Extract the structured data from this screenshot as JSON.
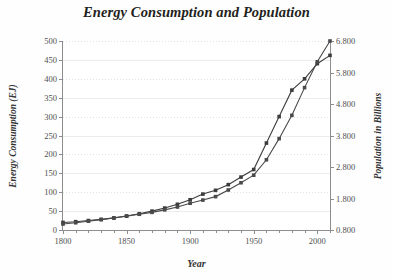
{
  "chart_data": {
    "type": "line",
    "title": "Energy Consumption and Population",
    "xlabel": "Year",
    "ylabel": "Energy Consumption (EJ)",
    "y2label": "Population in Billions",
    "grid": true,
    "legend": "none",
    "xlim": [
      1800,
      2010
    ],
    "ylim": [
      0,
      500
    ],
    "y2lim": [
      0.8,
      6.8
    ],
    "xticklabels": [
      "1800",
      "1850",
      "1900",
      "1950",
      "2000"
    ],
    "xtickvalues": [
      1800,
      1850,
      1900,
      1950,
      2000
    ],
    "xminor_step": 10,
    "yticklabels": [
      "0",
      "50",
      "100",
      "150",
      "200",
      "250",
      "300",
      "350",
      "400",
      "450",
      "500"
    ],
    "ytickvalues": [
      0,
      50,
      100,
      150,
      200,
      250,
      300,
      350,
      400,
      450,
      500
    ],
    "y2ticklabels": [
      "0.800",
      "1.800",
      "2.800",
      "3.800",
      "4.800",
      "5.800",
      "6.800"
    ],
    "y2tickvalues": [
      0.8,
      1.8,
      2.8,
      3.8,
      4.8,
      5.8,
      6.8
    ],
    "x": [
      1800,
      1810,
      1820,
      1830,
      1840,
      1850,
      1860,
      1870,
      1880,
      1890,
      1900,
      1910,
      1920,
      1930,
      1940,
      1950,
      1960,
      1970,
      1980,
      1990,
      2000,
      2010
    ],
    "series": [
      {
        "name": "Energy Consumption (EJ)",
        "axis": "left",
        "marker": "square",
        "color": "#3c3c3c",
        "values": [
          20,
          22,
          25,
          28,
          32,
          37,
          43,
          50,
          58,
          68,
          80,
          95,
          105,
          120,
          140,
          160,
          230,
          300,
          370,
          400,
          440,
          462
        ]
      },
      {
        "name": "Population in Billions",
        "axis": "right",
        "marker": "square",
        "color": "#4a4a4a",
        "values": [
          0.99,
          1.03,
          1.08,
          1.13,
          1.18,
          1.24,
          1.3,
          1.36,
          1.44,
          1.53,
          1.65,
          1.75,
          1.86,
          2.07,
          2.3,
          2.54,
          3.03,
          3.7,
          4.44,
          5.32,
          6.14,
          6.8
        ]
      }
    ]
  }
}
